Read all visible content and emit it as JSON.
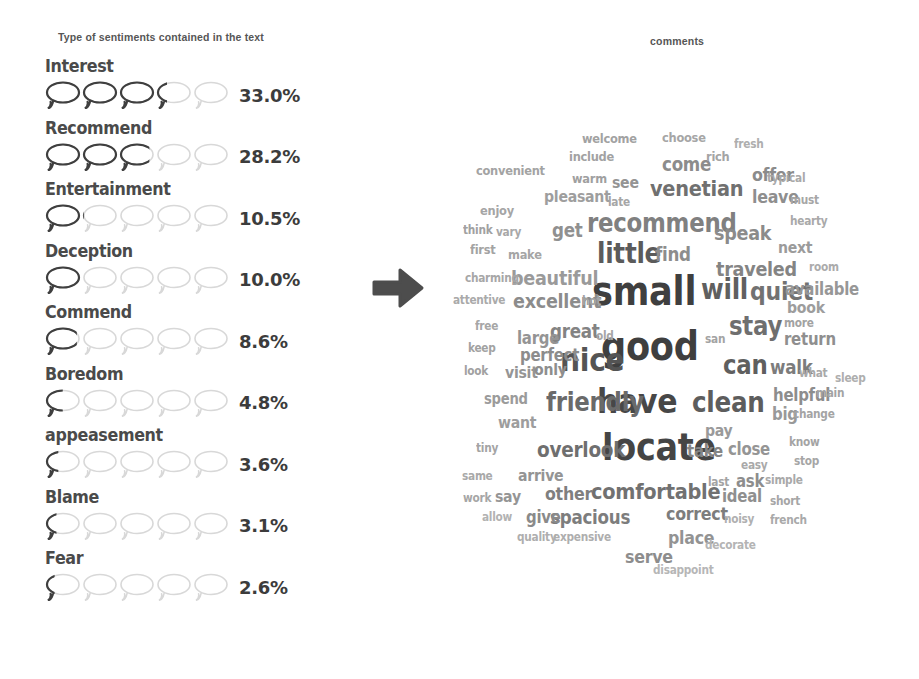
{
  "sentiment_panel": {
    "title": "Type of sentiments contained in the text",
    "bubble_count": 5,
    "bubble_scale_max": 50,
    "colors": {
      "filled": "#3f3f3f",
      "empty": "#d8d8d8",
      "label": "#4a4a4a",
      "value": "#3c3c3c",
      "title": "#565656"
    },
    "rows": [
      {
        "label": "Interest",
        "value": "33.0%",
        "percent": 33.0
      },
      {
        "label": "Recommend",
        "value": "28.2%",
        "percent": 28.2
      },
      {
        "label": "Entertainment",
        "value": "10.5%",
        "percent": 10.5
      },
      {
        "label": "Deception",
        "value": "10.0%",
        "percent": 10.0
      },
      {
        "label": "Commend",
        "value": "8.6%",
        "percent": 8.6
      },
      {
        "label": "Boredom",
        "value": "4.8%",
        "percent": 4.8
      },
      {
        "label": "appeasement",
        "value": "3.6%",
        "percent": 3.6
      },
      {
        "label": "Blame",
        "value": "3.1%",
        "percent": 3.1
      },
      {
        "label": "Fear",
        "value": "2.6%",
        "percent": 2.6
      }
    ]
  },
  "arrow": {
    "name": "right-arrow",
    "color": "#4d4d4d",
    "direction": "right"
  },
  "wordcloud_panel": {
    "title": "comments",
    "chart_data": {
      "type": "wordcloud",
      "title": "comments",
      "xlabel": "",
      "ylabel": "",
      "color_scale": [
        "#404040",
        "#6b6b6b",
        "#8f8f8f",
        "#b0b0b0",
        "#c9c9c9"
      ],
      "words": [
        {
          "text": "small",
          "size": 40,
          "x": 152,
          "y": 271,
          "color": "#3f3f3f"
        },
        {
          "text": "good",
          "size": 40,
          "x": 161,
          "y": 326,
          "color": "#3f3f3f"
        },
        {
          "text": "locate",
          "size": 38,
          "x": 162,
          "y": 428,
          "color": "#454545"
        },
        {
          "text": "have",
          "size": 34,
          "x": 157,
          "y": 384,
          "color": "#474747"
        },
        {
          "text": "recommend",
          "size": 26,
          "x": 147,
          "y": 210,
          "color": "#808080"
        },
        {
          "text": "nice",
          "size": 32,
          "x": 120,
          "y": 344,
          "color": "#545454"
        },
        {
          "text": "little",
          "size": 28,
          "x": 157,
          "y": 240,
          "color": "#5b5b5b"
        },
        {
          "text": "will",
          "size": 28,
          "x": 261,
          "y": 276,
          "color": "#606060"
        },
        {
          "text": "clean",
          "size": 28,
          "x": 252,
          "y": 389,
          "color": "#5d5d5d"
        },
        {
          "text": "friendly",
          "size": 26,
          "x": 106,
          "y": 389,
          "color": "#6a6a6a"
        },
        {
          "text": "comfortable",
          "size": 22,
          "x": 151,
          "y": 481,
          "color": "#717171"
        },
        {
          "text": "stay",
          "size": 26,
          "x": 289,
          "y": 313,
          "color": "#6f6f6f"
        },
        {
          "text": "quiet",
          "size": 25,
          "x": 310,
          "y": 279,
          "color": "#727272"
        },
        {
          "text": "can",
          "size": 26,
          "x": 283,
          "y": 352,
          "color": "#5f5f5f"
        },
        {
          "text": "venetian",
          "size": 22,
          "x": 210,
          "y": 178,
          "color": "#707070"
        },
        {
          "text": "overlook",
          "size": 21,
          "x": 97,
          "y": 440,
          "color": "#6f6f6f"
        },
        {
          "text": "excellent",
          "size": 20,
          "x": 73,
          "y": 291,
          "color": "#8c8c8c"
        },
        {
          "text": "spacious",
          "size": 19,
          "x": 110,
          "y": 508,
          "color": "#7d7d7d"
        },
        {
          "text": "traveled",
          "size": 20,
          "x": 276,
          "y": 259,
          "color": "#848484"
        },
        {
          "text": "beautiful",
          "size": 20,
          "x": 71,
          "y": 268,
          "color": "#9a9a9a"
        },
        {
          "text": "speak",
          "size": 20,
          "x": 274,
          "y": 223,
          "color": "#8b8b8b"
        },
        {
          "text": "walk",
          "size": 19,
          "x": 330,
          "y": 358,
          "color": "#7c7c7c"
        },
        {
          "text": "great",
          "size": 19,
          "x": 110,
          "y": 322,
          "color": "#838383"
        },
        {
          "text": "correct",
          "size": 18,
          "x": 226,
          "y": 505,
          "color": "#7d7d7d"
        },
        {
          "text": "helpful",
          "size": 17,
          "x": 333,
          "y": 387,
          "color": "#8d8d8d"
        },
        {
          "text": "take",
          "size": 17,
          "x": 247,
          "y": 443,
          "color": "#858585"
        },
        {
          "text": "other",
          "size": 18,
          "x": 105,
          "y": 485,
          "color": "#7f7f7f"
        },
        {
          "text": "serve",
          "size": 18,
          "x": 185,
          "y": 548,
          "color": "#8d8d8d"
        },
        {
          "text": "place",
          "size": 18,
          "x": 228,
          "y": 529,
          "color": "#939393"
        },
        {
          "text": "available",
          "size": 17,
          "x": 345,
          "y": 281,
          "color": "#979797"
        },
        {
          "text": "offer",
          "size": 18,
          "x": 312,
          "y": 166,
          "color": "#8b8b8b"
        },
        {
          "text": "come",
          "size": 19,
          "x": 222,
          "y": 155,
          "color": "#8c8c8c"
        },
        {
          "text": "find",
          "size": 19,
          "x": 215,
          "y": 245,
          "color": "#8d8d8d"
        },
        {
          "text": "return",
          "size": 17,
          "x": 344,
          "y": 331,
          "color": "#8f8f8f"
        },
        {
          "text": "perfect",
          "size": 17,
          "x": 80,
          "y": 347,
          "color": "#8c8c8c"
        },
        {
          "text": "ideal",
          "size": 17,
          "x": 282,
          "y": 488,
          "color": "#8f8f8f"
        },
        {
          "text": "close",
          "size": 17,
          "x": 288,
          "y": 441,
          "color": "#959595"
        },
        {
          "text": "get",
          "size": 19,
          "x": 112,
          "y": 221,
          "color": "#909090"
        },
        {
          "text": "leave",
          "size": 18,
          "x": 312,
          "y": 188,
          "color": "#8e8e8e"
        },
        {
          "text": "give",
          "size": 17,
          "x": 86,
          "y": 509,
          "color": "#8a8a8a"
        },
        {
          "text": "large",
          "size": 17,
          "x": 77,
          "y": 330,
          "color": "#949494"
        },
        {
          "text": "ask",
          "size": 17,
          "x": 296,
          "y": 473,
          "color": "#8d8d8d"
        },
        {
          "text": "arrive",
          "size": 16,
          "x": 78,
          "y": 468,
          "color": "#949494"
        },
        {
          "text": "big",
          "size": 17,
          "x": 332,
          "y": 406,
          "color": "#999999"
        },
        {
          "text": "visit",
          "size": 16,
          "x": 65,
          "y": 365,
          "color": "#959595"
        },
        {
          "text": "next",
          "size": 16,
          "x": 338,
          "y": 240,
          "color": "#9b9b9b"
        },
        {
          "text": "pay",
          "size": 16,
          "x": 265,
          "y": 423,
          "color": "#9a9a9a"
        },
        {
          "text": "say",
          "size": 16,
          "x": 55,
          "y": 489,
          "color": "#959595"
        },
        {
          "text": "book",
          "size": 16,
          "x": 347,
          "y": 300,
          "color": "#9d9d9d"
        },
        {
          "text": "only",
          "size": 16,
          "x": 94,
          "y": 362,
          "color": "#8e8e8e"
        },
        {
          "text": "want",
          "size": 16,
          "x": 58,
          "y": 415,
          "color": "#9d9d9d"
        },
        {
          "text": "spend",
          "size": 15,
          "x": 44,
          "y": 392,
          "color": "#9b9b9b"
        },
        {
          "text": "pleasant",
          "size": 16,
          "x": 104,
          "y": 189,
          "color": "#9e9e9e"
        },
        {
          "text": "convenient",
          "size": 13,
          "x": 36,
          "y": 164,
          "color": "#a3a3a3"
        },
        {
          "text": "warm",
          "size": 13,
          "x": 132,
          "y": 172,
          "color": "#a0a0a0"
        },
        {
          "text": "see",
          "size": 16,
          "x": 172,
          "y": 175,
          "color": "#949494"
        },
        {
          "text": "welcome",
          "size": 13,
          "x": 142,
          "y": 132,
          "color": "#a2a2a2"
        },
        {
          "text": "choose",
          "size": 13,
          "x": 222,
          "y": 131,
          "color": "#a6a6a6"
        },
        {
          "text": "include",
          "size": 13,
          "x": 129,
          "y": 150,
          "color": "#a2a2a2"
        },
        {
          "text": "rich",
          "size": 13,
          "x": 266,
          "y": 150,
          "color": "#a4a4a4"
        },
        {
          "text": "fresh",
          "size": 12,
          "x": 294,
          "y": 138,
          "color": "#aeaeae"
        },
        {
          "text": "typical",
          "size": 12,
          "x": 327,
          "y": 172,
          "color": "#a9a9a9"
        },
        {
          "text": "must",
          "size": 12,
          "x": 350,
          "y": 194,
          "color": "#a6a6a6"
        },
        {
          "text": "hearty",
          "size": 12,
          "x": 350,
          "y": 215,
          "color": "#a9a9a9"
        },
        {
          "text": "room",
          "size": 12,
          "x": 369,
          "y": 261,
          "color": "#ababab"
        },
        {
          "text": "more",
          "size": 12,
          "x": 344,
          "y": 317,
          "color": "#a2a2a2"
        },
        {
          "text": "what",
          "size": 12,
          "x": 359,
          "y": 367,
          "color": "#a9a9a9"
        },
        {
          "text": "sleep",
          "size": 12,
          "x": 395,
          "y": 372,
          "color": "#aeaeae"
        },
        {
          "text": "main",
          "size": 12,
          "x": 376,
          "y": 387,
          "color": "#a3a3a3"
        },
        {
          "text": "change",
          "size": 12,
          "x": 353,
          "y": 408,
          "color": "#a4a4a4"
        },
        {
          "text": "know",
          "size": 12,
          "x": 349,
          "y": 436,
          "color": "#a4a4a4"
        },
        {
          "text": "stop",
          "size": 12,
          "x": 354,
          "y": 455,
          "color": "#a6a6a6"
        },
        {
          "text": "easy",
          "size": 12,
          "x": 301,
          "y": 459,
          "color": "#a9a9a9"
        },
        {
          "text": "last",
          "size": 12,
          "x": 268,
          "y": 476,
          "color": "#a3a3a3"
        },
        {
          "text": "simple",
          "size": 12,
          "x": 325,
          "y": 474,
          "color": "#a9a9a9"
        },
        {
          "text": "short",
          "size": 12,
          "x": 330,
          "y": 495,
          "color": "#a6a6a6"
        },
        {
          "text": "french",
          "size": 12,
          "x": 330,
          "y": 514,
          "color": "#a9a9a9"
        },
        {
          "text": "noisy",
          "size": 12,
          "x": 284,
          "y": 513,
          "color": "#b0b0b0"
        },
        {
          "text": "decorate",
          "size": 12,
          "x": 265,
          "y": 539,
          "color": "#b4b4b4"
        },
        {
          "text": "disappoint",
          "size": 12,
          "x": 213,
          "y": 564,
          "color": "#b6b6b6"
        },
        {
          "text": "quality",
          "size": 12,
          "x": 77,
          "y": 531,
          "color": "#aeaeae"
        },
        {
          "text": "expensive",
          "size": 12,
          "x": 113,
          "y": 531,
          "color": "#aeaeae"
        },
        {
          "text": "allow",
          "size": 12,
          "x": 42,
          "y": 511,
          "color": "#b2b2b2"
        },
        {
          "text": "work",
          "size": 12,
          "x": 23,
          "y": 492,
          "color": "#a6a6a6"
        },
        {
          "text": "same",
          "size": 12,
          "x": 22,
          "y": 470,
          "color": "#a9a9a9"
        },
        {
          "text": "tiny",
          "size": 12,
          "x": 36,
          "y": 442,
          "color": "#a4a4a4"
        },
        {
          "text": "look",
          "size": 12,
          "x": 24,
          "y": 365,
          "color": "#a1a1a1"
        },
        {
          "text": "keep",
          "size": 12,
          "x": 28,
          "y": 342,
          "color": "#a2a2a2"
        },
        {
          "text": "free",
          "size": 12,
          "x": 35,
          "y": 320,
          "color": "#a6a6a6"
        },
        {
          "text": "old",
          "size": 12,
          "x": 156,
          "y": 330,
          "color": "#a6a6a6"
        },
        {
          "text": "san",
          "size": 12,
          "x": 265,
          "y": 333,
          "color": "#a3a3a3"
        },
        {
          "text": "hot",
          "size": 12,
          "x": 142,
          "y": 295,
          "color": "#a4a4a4"
        },
        {
          "text": "attentive",
          "size": 12,
          "x": 13,
          "y": 294,
          "color": "#aaaaaa"
        },
        {
          "text": "charming",
          "size": 12,
          "x": 25,
          "y": 272,
          "color": "#a7a7a7"
        },
        {
          "text": "first",
          "size": 13,
          "x": 30,
          "y": 243,
          "color": "#a3a3a3"
        },
        {
          "text": "make",
          "size": 13,
          "x": 68,
          "y": 248,
          "color": "#a5a5a5"
        },
        {
          "text": "think",
          "size": 12,
          "x": 23,
          "y": 224,
          "color": "#a1a1a1"
        },
        {
          "text": "vary",
          "size": 12,
          "x": 56,
          "y": 226,
          "color": "#a8a8a8"
        },
        {
          "text": "enjoy",
          "size": 13,
          "x": 40,
          "y": 204,
          "color": "#a5a5a5"
        },
        {
          "text": "late",
          "size": 12,
          "x": 168,
          "y": 196,
          "color": "#a6a6a6"
        }
      ]
    }
  }
}
